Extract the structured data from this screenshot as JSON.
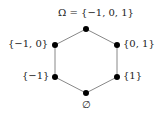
{
  "diagram": {
    "type": "hasse-diagram",
    "nodes": [
      {
        "id": "top",
        "label": "Ω = {−1, 0, 1}",
        "x": 86,
        "y": 29
      },
      {
        "id": "ul",
        "label": "{−1, 0}",
        "x": 55,
        "y": 45
      },
      {
        "id": "ur",
        "label": "{0, 1}",
        "x": 117,
        "y": 45
      },
      {
        "id": "ll",
        "label": "{−1}",
        "x": 55,
        "y": 77
      },
      {
        "id": "lr",
        "label": "{1}",
        "x": 117,
        "y": 77
      },
      {
        "id": "bottom",
        "label": "∅",
        "x": 86,
        "y": 93
      }
    ],
    "edges": [
      [
        "top",
        "ul"
      ],
      [
        "top",
        "ur"
      ],
      [
        "ul",
        "ll"
      ],
      [
        "ur",
        "lr"
      ],
      [
        "ll",
        "bottom"
      ],
      [
        "lr",
        "bottom"
      ]
    ],
    "colors": {
      "edge": "#888888",
      "node": "#000000"
    }
  }
}
